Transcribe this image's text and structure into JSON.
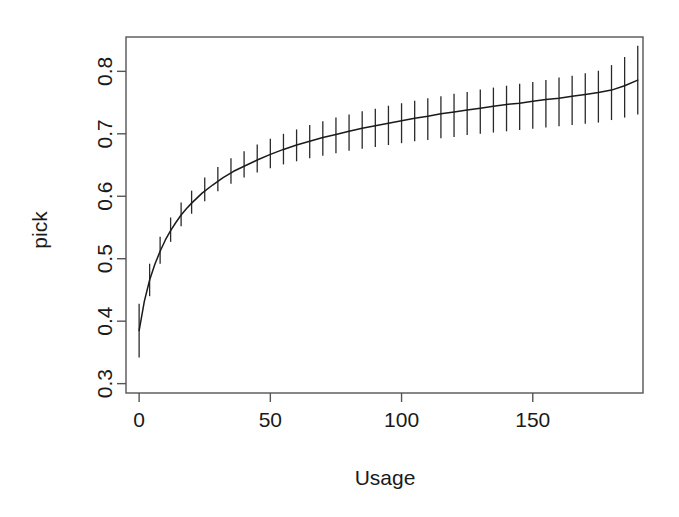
{
  "figure": {
    "background_color": "#ffffff",
    "line_color": "#1a1a1a",
    "frame_color": "#555555"
  },
  "chart_data": {
    "type": "line",
    "title": "",
    "subtitle": "",
    "xlabel": "Usage",
    "ylabel": "pick",
    "xlim": [
      -5,
      192
    ],
    "ylim": [
      0.285,
      0.855
    ],
    "grid": false,
    "legend": null,
    "annotations": [],
    "xticks": [
      0,
      50,
      100,
      150
    ],
    "xtick_labels": [
      "0",
      "50",
      "100",
      "150"
    ],
    "yticks": [
      0.3,
      0.4,
      0.5,
      0.6,
      0.7,
      0.8
    ],
    "ytick_labels": [
      "0.3",
      "0.4",
      "0.5",
      "0.6",
      "0.7",
      "0.8"
    ],
    "series": [
      {
        "name": "fitted pick probability",
        "style": "line-with-errorbars",
        "x": [
          0,
          2,
          4,
          6,
          8,
          10,
          12,
          14,
          16,
          18,
          20,
          24,
          28,
          32,
          36,
          40,
          45,
          50,
          55,
          60,
          65,
          70,
          75,
          80,
          85,
          90,
          95,
          100,
          105,
          110,
          115,
          120,
          125,
          130,
          135,
          140,
          145,
          150,
          155,
          160,
          165,
          170,
          175,
          180,
          185,
          190
        ],
        "y": [
          0.385,
          0.432,
          0.466,
          0.491,
          0.512,
          0.53,
          0.545,
          0.558,
          0.57,
          0.58,
          0.589,
          0.605,
          0.618,
          0.63,
          0.64,
          0.648,
          0.658,
          0.667,
          0.675,
          0.682,
          0.688,
          0.694,
          0.699,
          0.704,
          0.709,
          0.713,
          0.717,
          0.721,
          0.725,
          0.728,
          0.732,
          0.735,
          0.738,
          0.741,
          0.744,
          0.747,
          0.749,
          0.752,
          0.755,
          0.757,
          0.76,
          0.763,
          0.766,
          0.77,
          0.777,
          0.786
        ]
      }
    ],
    "errorbars": {
      "description": "vertical confidence interval bars drawn at regular Usage intervals",
      "x": [
        0,
        4,
        8,
        12,
        16,
        20,
        25,
        30,
        35,
        40,
        45,
        50,
        55,
        60,
        65,
        70,
        75,
        80,
        85,
        90,
        95,
        100,
        105,
        110,
        115,
        120,
        125,
        130,
        135,
        140,
        145,
        150,
        155,
        160,
        165,
        170,
        175,
        180,
        185,
        190
      ],
      "lower": [
        0.342,
        0.44,
        0.492,
        0.527,
        0.552,
        0.572,
        0.592,
        0.608,
        0.62,
        0.63,
        0.638,
        0.645,
        0.651,
        0.656,
        0.661,
        0.665,
        0.669,
        0.673,
        0.676,
        0.679,
        0.682,
        0.685,
        0.688,
        0.69,
        0.693,
        0.695,
        0.698,
        0.7,
        0.702,
        0.704,
        0.706,
        0.708,
        0.71,
        0.712,
        0.714,
        0.716,
        0.718,
        0.722,
        0.726,
        0.731
      ],
      "upper": [
        0.428,
        0.492,
        0.535,
        0.566,
        0.59,
        0.609,
        0.63,
        0.647,
        0.661,
        0.672,
        0.683,
        0.692,
        0.7,
        0.707,
        0.714,
        0.72,
        0.726,
        0.731,
        0.736,
        0.74,
        0.745,
        0.749,
        0.753,
        0.757,
        0.76,
        0.764,
        0.767,
        0.771,
        0.774,
        0.777,
        0.78,
        0.783,
        0.786,
        0.79,
        0.793,
        0.797,
        0.801,
        0.81,
        0.823,
        0.841
      ]
    }
  },
  "axes": {
    "x_axis_title": "Usage",
    "y_axis_title": "pick"
  }
}
